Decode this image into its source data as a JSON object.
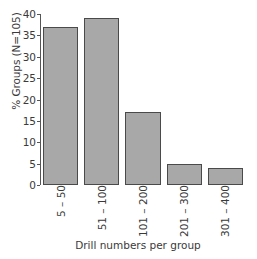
{
  "chart_data": {
    "type": "bar",
    "title": "",
    "subtitle": "",
    "xlabel": "Drill numbers per group",
    "ylabel": "% Groups (N=105)",
    "categories": [
      "5 – 50",
      "51 – 100",
      "101 – 200",
      "201 – 300",
      "301 – 400"
    ],
    "values": [
      37,
      39,
      17,
      5,
      4
    ],
    "series": [
      {
        "name": "% Groups",
        "values": [
          37,
          39,
          17,
          5,
          4
        ]
      }
    ],
    "ylim": [
      0,
      40
    ],
    "xlim": [
      0,
      5
    ],
    "ytick_labels": [
      "0",
      "5",
      "10",
      "15",
      "20",
      "25",
      "30",
      "35",
      "40"
    ],
    "ytick_values": [
      0,
      5,
      10,
      15,
      20,
      25,
      30,
      35,
      40
    ],
    "grid": false,
    "legend": false,
    "legend_position": "none",
    "annotations": [],
    "colors": {
      "bar_fill": "#a8a8a8",
      "bar_edge": "#4a4a4a",
      "axis": "#555555",
      "text": "#3a3a3a",
      "background": "#ffffff"
    }
  }
}
